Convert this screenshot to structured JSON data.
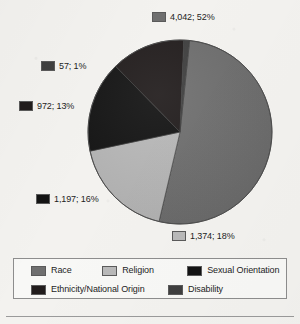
{
  "chart_data": {
    "type": "pie",
    "title": "",
    "subtitle": "",
    "legend_position": "bottom",
    "total": 7642,
    "categories": [
      "Race",
      "Religion",
      "Sexual Orientation",
      "Ethnicity/National Origin",
      "Disability"
    ],
    "values": [
      4042,
      1374,
      1197,
      972,
      57
    ],
    "percentages": [
      52,
      18,
      16,
      13,
      1
    ],
    "colors": [
      "#6f6f6f",
      "#b9b9b9",
      "#131313",
      "#211c1c",
      "#3f3f3f"
    ],
    "slices": [
      {
        "name": "Race",
        "value": 4042,
        "percent": 52,
        "color": "#6f6f6f",
        "callout": "4,042; 52%"
      },
      {
        "name": "Religion",
        "value": 1374,
        "percent": 18,
        "color": "#b9b9b9",
        "callout": "1,374; 18%"
      },
      {
        "name": "Sexual Orientation",
        "value": 1197,
        "percent": 16,
        "color": "#131313",
        "callout": "1,197; 16%"
      },
      {
        "name": "Ethnicity/National Origin",
        "value": 972,
        "percent": 13,
        "color": "#211c1c",
        "callout": "972; 13%"
      },
      {
        "name": "Disability",
        "value": 57,
        "percent": 1,
        "color": "#3f3f3f",
        "callout": "57; 1%"
      }
    ]
  },
  "legend": {
    "row1": [
      {
        "label": "Race",
        "color": "#6f6f6f"
      },
      {
        "label": "Religion",
        "color": "#b9b9b9"
      },
      {
        "label": "Sexual Orientation",
        "color": "#131313"
      }
    ],
    "row2": [
      {
        "label": "Ethnicity/National Origin",
        "color": "#211c1c"
      },
      {
        "label": "Disability",
        "color": "#3f3f3f"
      }
    ]
  }
}
